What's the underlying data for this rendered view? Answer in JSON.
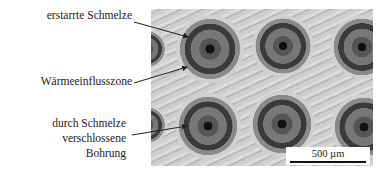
{
  "labels": {
    "melt": "erstarrte Schmelze",
    "haz": "Wärmeeinflusszone",
    "hole_line1": "durch Schmelze",
    "hole_line2": "verschlossene",
    "hole_line3": "Bohrung"
  },
  "scale_bar": {
    "text": "500 µm"
  },
  "micrograph": {
    "holes": [
      {
        "cx": 59,
        "cy": 40,
        "r": 34
      },
      {
        "cx": 132,
        "cy": 37,
        "r": 31
      },
      {
        "cx": 211,
        "cy": 38,
        "r": 32
      },
      {
        "cx": 57,
        "cy": 117,
        "r": 33
      },
      {
        "cx": 131,
        "cy": 115,
        "r": 33
      },
      {
        "cx": 213,
        "cy": 118,
        "r": 33
      },
      {
        "cx": -4,
        "cy": 40,
        "r": 20
      },
      {
        "cx": -4,
        "cy": 116,
        "r": 20
      }
    ]
  }
}
